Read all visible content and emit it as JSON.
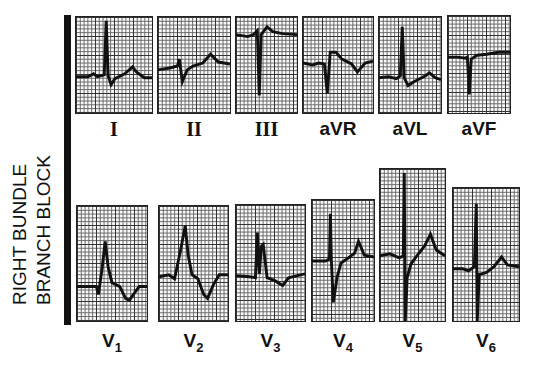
{
  "figure": {
    "side_title_line1": "RIGHT BUNDLE",
    "side_title_line2": "BRANCH BLOCK",
    "limb_leads": [
      {
        "label": "I"
      },
      {
        "label": "II"
      },
      {
        "label": "III"
      },
      {
        "label": "aVR"
      },
      {
        "label": "aVL"
      },
      {
        "label": "aVF"
      }
    ],
    "precordial_leads": [
      {
        "label": "V",
        "sub": "1"
      },
      {
        "label": "V",
        "sub": "2"
      },
      {
        "label": "V",
        "sub": "3"
      },
      {
        "label": "V",
        "sub": "4"
      },
      {
        "label": "V",
        "sub": "5"
      },
      {
        "label": "V",
        "sub": "6"
      }
    ],
    "trace_color": "#111111",
    "grid_color": "#333333"
  }
}
